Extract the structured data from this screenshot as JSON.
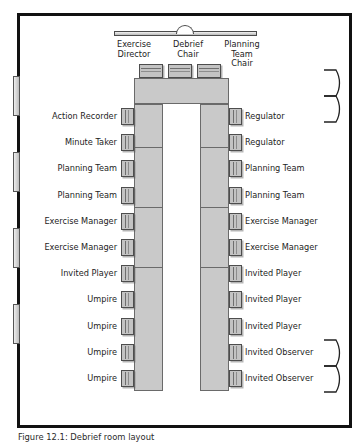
{
  "diagram": {
    "caption": "Figure 12.1: Debrief room layout",
    "room": {
      "border_color": "#111111",
      "fill_color": "#ffffff"
    },
    "screen": {
      "name": "projector-screen",
      "notch": "semicircular"
    },
    "table": {
      "shape": "u-shaped",
      "fill_color": "#c9c9c9",
      "outline_color": "#6a6a6a"
    },
    "chair_colors": {
      "fill": "#c3c3c3",
      "outline": "#4d4d4d"
    },
    "head_positions": [
      {
        "label": "Exercise\nDirector",
        "line1": "Exercise",
        "line2": "Director"
      },
      {
        "label": "Debrief\nChair",
        "line1": "Debrief",
        "line2": "Chair"
      },
      {
        "label": "Planning Team\nChair",
        "line1": "Planning Team",
        "line2": "Chair"
      }
    ],
    "left_seats": [
      {
        "label": "Action Recorder"
      },
      {
        "label": "Minute Taker"
      },
      {
        "label": "Planning Team"
      },
      {
        "label": "Planning Team"
      },
      {
        "label": "Exercise Manager"
      },
      {
        "label": "Exercise Manager"
      },
      {
        "label": "Invited Player"
      },
      {
        "label": "Umpire"
      },
      {
        "label": "Umpire"
      },
      {
        "label": "Umpire"
      },
      {
        "label": "Umpire"
      }
    ],
    "right_seats": [
      {
        "label": "Regulator"
      },
      {
        "label": "Regulator"
      },
      {
        "label": "Planning Team"
      },
      {
        "label": "Planning Team"
      },
      {
        "label": "Exercise Manager"
      },
      {
        "label": "Exercise Manager"
      },
      {
        "label": "Invited Player"
      },
      {
        "label": "Invited Player"
      },
      {
        "label": "Invited Player"
      },
      {
        "label": "Invited Observer"
      },
      {
        "label": "Invited Observer"
      }
    ],
    "left_wall_windows": 4,
    "right_wall_doors": 2
  }
}
